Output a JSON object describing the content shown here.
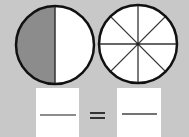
{
  "figure": {
    "background": "#c8c8c8",
    "circles": [
      {
        "name": "half-circle",
        "parts": 2,
        "shaded": 1,
        "shade_color": "#8a8a8a"
      },
      {
        "name": "eighths-circle",
        "parts": 8,
        "shaded": 0
      }
    ],
    "equation": {
      "left_blank": "",
      "operator": "=",
      "right_blank": ""
    }
  }
}
